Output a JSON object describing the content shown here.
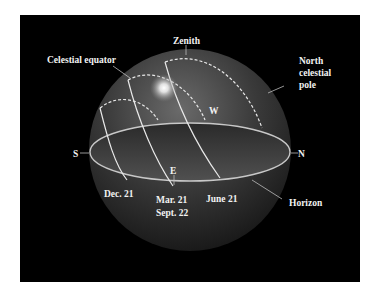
{
  "labels": {
    "zenith": "Zenith",
    "celestial_equator": "Celestial equator",
    "north_celestial_pole": [
      "North",
      "celestial",
      "pole"
    ],
    "west": "W",
    "east": "E",
    "south": "S",
    "north": "N",
    "horizon": "Horizon",
    "dec21": "Dec. 21",
    "mar21": "Mar. 21",
    "sept22": "Sept. 22",
    "june21": "June 21"
  },
  "colors": {
    "background": "#000000",
    "page": "#ffffff",
    "lines": "#e8e8e8",
    "sphere": "#3a3a3a"
  }
}
